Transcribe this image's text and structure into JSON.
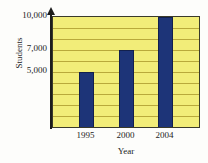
{
  "chart_data": {
    "type": "bar",
    "title": "",
    "subtitle": "",
    "categories": [
      "1995",
      "2000",
      "2004"
    ],
    "values": [
      5000,
      7000,
      10000
    ],
    "series": [
      {
        "name": "Students",
        "values": [
          5000,
          7000,
          10000
        ]
      }
    ],
    "xlabel": "Year",
    "ylabel": "Students",
    "ylim": [
      0,
      10000
    ],
    "ytick_labels": [
      "10,000",
      "7,000",
      "5,000"
    ],
    "ytick_values": [
      10000,
      7000,
      5000
    ],
    "xtick_labels": [
      "1995",
      "2000",
      "2004"
    ],
    "grid": true,
    "grid_interval": 1000,
    "grid_count": 10,
    "legend": null,
    "legend_position": "none",
    "annotations": [],
    "colors": {
      "bar": "#1d3478",
      "bar_edge": "#12204d",
      "plot_background": "#f2ed79",
      "gridline": "#b9a93b",
      "axis": "#1c1c1c",
      "canvas_background": "#fdfdfb",
      "text": "#1c1c1c"
    }
  },
  "axis": {
    "y_arrow_icon": "arrow-up-icon"
  }
}
